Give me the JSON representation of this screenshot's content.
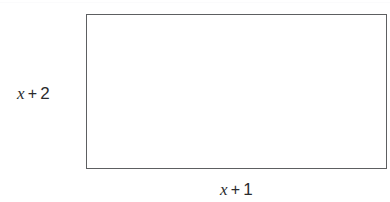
{
  "figure": {
    "kind": "rectangle-diagram",
    "background_color": "#ffffff",
    "stroke_color": "#5d5f61",
    "text_color": "#2b2b2d",
    "rectangle": {
      "left": 86,
      "top": 14,
      "width": 301,
      "height": 155
    },
    "labels": {
      "height": {
        "full_text": "x + 2",
        "variable": "x",
        "operator": "+",
        "constant": "2",
        "position": "left"
      },
      "width": {
        "full_text": "x + 1",
        "variable": "x",
        "operator": "+",
        "constant": "1",
        "position": "bottom"
      }
    }
  }
}
